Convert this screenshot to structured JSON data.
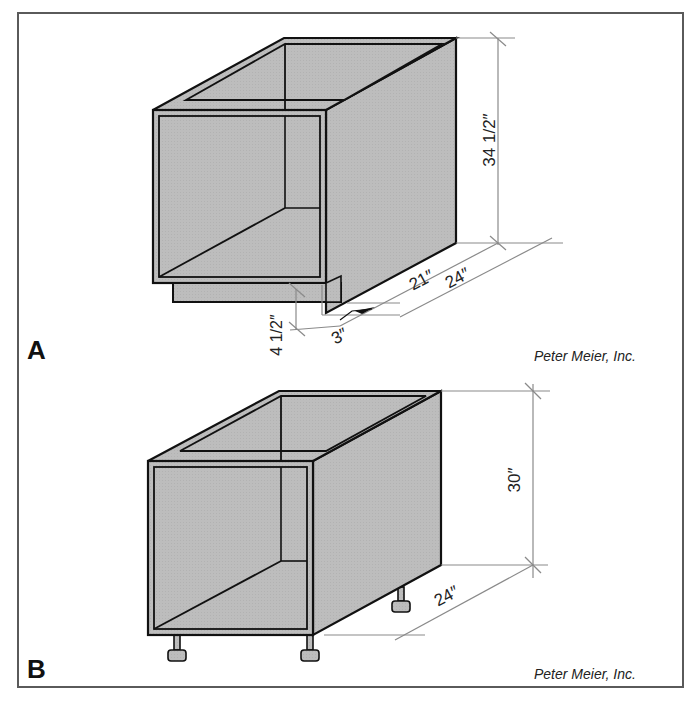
{
  "figure": {
    "panels": [
      {
        "id": "A",
        "label": "A",
        "credit": "Peter Meier, Inc.",
        "subject": "Base cabinet with toe kick",
        "dimensions": {
          "height": "34 1/2″",
          "inner_depth": "21″",
          "overall_depth": "24″",
          "toe_kick_height": "4 1/2″",
          "toe_kick_depth": "3″"
        }
      },
      {
        "id": "B",
        "label": "B",
        "credit": "Peter Meier, Inc.",
        "subject": "Frameless base cabinet on leveling legs",
        "dimensions": {
          "height": "30″",
          "depth": "24″"
        }
      }
    ],
    "colors": {
      "panel_fill": "#bdbdbd",
      "outline": "#111111",
      "dimension_line": "#8a8a8a",
      "frame": "#5a5a5a",
      "background": "#ffffff"
    }
  }
}
